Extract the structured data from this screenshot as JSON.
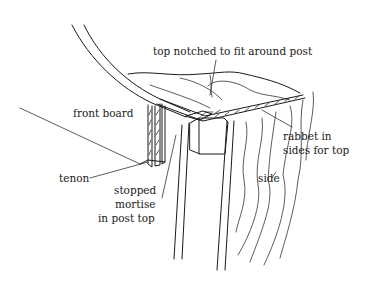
{
  "figure": {
    "type": "woodworking joinery illustration",
    "labels": {
      "top_notched": "top notched to fit around post",
      "front_board": "front board",
      "rabbet_line1": "rabbet in",
      "rabbet_line2": "sides for top",
      "tenon": "tenon",
      "mortise_line1": "stopped",
      "mortise_line2": "mortise",
      "mortise_line3": "in post top",
      "side": "side"
    },
    "colors": {
      "ink": "#1a1a1a",
      "background": "#ffffff"
    }
  }
}
